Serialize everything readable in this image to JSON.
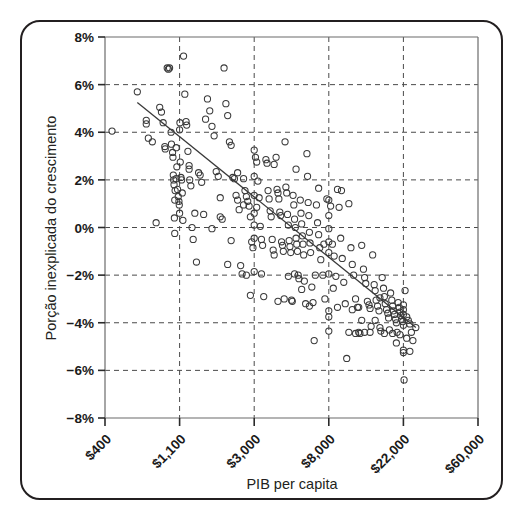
{
  "chart_data": {
    "type": "scatter",
    "title": "",
    "xlabel": "PIB per capita",
    "ylabel": "Porção inexplicada do crescimento",
    "xscale": "log",
    "x_tick_labels": [
      "$400",
      "$1,100",
      "$3,000",
      "$8,000",
      "$22,000",
      "$60,000"
    ],
    "x_tick_values": [
      400,
      1100,
      3000,
      8000,
      22000,
      60000
    ],
    "y_tick_labels": [
      "8%",
      "6%",
      "4%",
      "2%",
      "0%",
      "−2%",
      "−4%",
      "−6%",
      "−8%"
    ],
    "y_tick_values": [
      8,
      6,
      4,
      2,
      0,
      -2,
      -4,
      -6,
      -8
    ],
    "ylim": [
      -8,
      8
    ],
    "xlim": [
      400,
      60000
    ],
    "grid": true,
    "grid_style": "dashed",
    "legend": "none",
    "marker": "open-circle",
    "marker_color": "#3a3a3a",
    "trendline": {
      "present": true,
      "x_start": 620,
      "y_start": 5.25,
      "x_end": 26000,
      "y_end": -4.2,
      "color": "#3a3a3a"
    },
    "points": [
      [
        440,
        4.05
      ],
      [
        620,
        5.7
      ],
      [
        700,
        4.5
      ],
      [
        700,
        4.35
      ],
      [
        720,
        3.75
      ],
      [
        760,
        3.6
      ],
      [
        800,
        0.2
      ],
      [
        840,
        5.05
      ],
      [
        860,
        4.85
      ],
      [
        880,
        4.4
      ],
      [
        900,
        3.4
      ],
      [
        905,
        3.3
      ],
      [
        930,
        6.7
      ],
      [
        945,
        6.65
      ],
      [
        960,
        6.7
      ],
      [
        980,
        4.0
      ],
      [
        985,
        3.5
      ],
      [
        1000,
        3.15
      ],
      [
        1005,
        2.95
      ],
      [
        1010,
        2.2
      ],
      [
        1020,
        1.8
      ],
      [
        1030,
        -0.25
      ],
      [
        1050,
        3.35
      ],
      [
        1060,
        2.55
      ],
      [
        1070,
        1.6
      ],
      [
        1080,
        1.3
      ],
      [
        1090,
        1.1
      ],
      [
        1095,
        0.95
      ],
      [
        1100,
        0.6
      ],
      [
        1100,
        4.1
      ],
      [
        1105,
        4.4
      ],
      [
        1110,
        2.75
      ],
      [
        1120,
        2.1
      ],
      [
        1130,
        2.0
      ],
      [
        1140,
        1.45
      ],
      [
        1150,
        0.3
      ],
      [
        1160,
        7.2
      ],
      [
        1180,
        5.6
      ],
      [
        1200,
        4.45
      ],
      [
        1210,
        4.3
      ],
      [
        1230,
        3.2
      ],
      [
        1250,
        2.45
      ],
      [
        1260,
        2.0
      ],
      [
        1280,
        1.75
      ],
      [
        1300,
        0.0
      ],
      [
        1320,
        -0.5
      ],
      [
        1350,
        0.6
      ],
      [
        1380,
        -1.45
      ],
      [
        1420,
        2.3
      ],
      [
        1450,
        2.2
      ],
      [
        1480,
        1.9
      ],
      [
        1520,
        0.55
      ],
      [
        1560,
        4.55
      ],
      [
        1600,
        5.4
      ],
      [
        1650,
        4.9
      ],
      [
        1700,
        4.25
      ],
      [
        1750,
        3.85
      ],
      [
        1800,
        2.35
      ],
      [
        1850,
        2.15
      ],
      [
        1900,
        1.25
      ],
      [
        1950,
        0.35
      ],
      [
        2000,
        6.7
      ],
      [
        2050,
        5.2
      ],
      [
        2100,
        4.7
      ],
      [
        2150,
        3.6
      ],
      [
        2200,
        3.45
      ],
      [
        2250,
        2.1
      ],
      [
        2300,
        2.05
      ],
      [
        2350,
        1.35
      ],
      [
        2400,
        1.15
      ],
      [
        2450,
        0.75
      ],
      [
        2500,
        -1.6
      ],
      [
        2550,
        -1.95
      ],
      [
        2600,
        2.05
      ],
      [
        2650,
        1.55
      ],
      [
        2700,
        1.3
      ],
      [
        2750,
        1.1
      ],
      [
        2800,
        0.9
      ],
      [
        2850,
        0.45
      ],
      [
        2900,
        -0.6
      ],
      [
        2950,
        -0.85
      ],
      [
        3000,
        3.25
      ],
      [
        3000,
        2.15
      ],
      [
        3000,
        1.35
      ],
      [
        3000,
        0.6
      ],
      [
        3000,
        0.1
      ],
      [
        3000,
        -0.45
      ],
      [
        3000,
        -1.85
      ],
      [
        3050,
        2.95
      ],
      [
        3100,
        2.75
      ],
      [
        3150,
        1.95
      ],
      [
        3200,
        1.25
      ],
      [
        3250,
        0.05
      ],
      [
        3300,
        -0.5
      ],
      [
        3350,
        -0.75
      ],
      [
        3400,
        -2.9
      ],
      [
        3500,
        2.85
      ],
      [
        3550,
        2.7
      ],
      [
        3600,
        1.55
      ],
      [
        3650,
        1.2
      ],
      [
        3700,
        0.7
      ],
      [
        3750,
        0.45
      ],
      [
        3800,
        -0.5
      ],
      [
        3850,
        -0.95
      ],
      [
        3900,
        -1.15
      ],
      [
        4000,
        2.95
      ],
      [
        4050,
        1.6
      ],
      [
        4100,
        1.45
      ],
      [
        4150,
        1.2
      ],
      [
        4200,
        0.65
      ],
      [
        4250,
        0.5
      ],
      [
        4300,
        -0.6
      ],
      [
        4350,
        -0.75
      ],
      [
        4400,
        -1.0
      ],
      [
        4500,
        3.6
      ],
      [
        4550,
        1.7
      ],
      [
        4600,
        1.45
      ],
      [
        4650,
        0.55
      ],
      [
        4700,
        0.1
      ],
      [
        4750,
        -0.55
      ],
      [
        4800,
        -0.8
      ],
      [
        4850,
        -1.05
      ],
      [
        4900,
        -3.05
      ],
      [
        4950,
        -3.1
      ],
      [
        5000,
        1.35
      ],
      [
        5050,
        0.95
      ],
      [
        5100,
        0.35
      ],
      [
        5150,
        0.0
      ],
      [
        5200,
        -0.45
      ],
      [
        5250,
        -0.7
      ],
      [
        5300,
        -1.0
      ],
      [
        5350,
        -2.0
      ],
      [
        5400,
        -2.15
      ],
      [
        5500,
        1.15
      ],
      [
        5550,
        0.6
      ],
      [
        5600,
        0.15
      ],
      [
        5650,
        -0.35
      ],
      [
        5700,
        -0.7
      ],
      [
        5750,
        -1.15
      ],
      [
        5800,
        -2.25
      ],
      [
        5900,
        -3.2
      ],
      [
        6000,
        3.1
      ],
      [
        6050,
        2.15
      ],
      [
        6100,
        1.05
      ],
      [
        6150,
        0.5
      ],
      [
        6200,
        -0.2
      ],
      [
        6250,
        -0.65
      ],
      [
        6300,
        -1.05
      ],
      [
        6400,
        -2.5
      ],
      [
        6500,
        -3.15
      ],
      [
        6600,
        -4.75
      ],
      [
        6800,
        0.95
      ],
      [
        6900,
        0.2
      ],
      [
        7000,
        -0.3
      ],
      [
        7100,
        -0.85
      ],
      [
        7200,
        -1.35
      ],
      [
        7400,
        -2.0
      ],
      [
        7600,
        -3.0
      ],
      [
        7800,
        1.2
      ],
      [
        8000,
        1.15
      ],
      [
        8000,
        0.5
      ],
      [
        8000,
        -0.05
      ],
      [
        8000,
        -0.6
      ],
      [
        8000,
        -1.05
      ],
      [
        8000,
        -1.95
      ],
      [
        8000,
        -3.5
      ],
      [
        8000,
        -3.75
      ],
      [
        8000,
        -4.35
      ],
      [
        8200,
        0.9
      ],
      [
        8400,
        -0.7
      ],
      [
        8600,
        -1.2
      ],
      [
        8800,
        -2.05
      ],
      [
        9000,
        1.6
      ],
      [
        9200,
        0.85
      ],
      [
        9400,
        -0.45
      ],
      [
        9600,
        -1.3
      ],
      [
        9800,
        -2.3
      ],
      [
        10000,
        -3.2
      ],
      [
        10200,
        -5.5
      ],
      [
        10500,
        1.0
      ],
      [
        10800,
        -0.85
      ],
      [
        11000,
        -1.55
      ],
      [
        11200,
        -2.0
      ],
      [
        11500,
        -3.0
      ],
      [
        11800,
        -3.35
      ],
      [
        12000,
        -4.4
      ],
      [
        12200,
        -4.45
      ],
      [
        12500,
        -0.75
      ],
      [
        12800,
        -1.75
      ],
      [
        13000,
        -2.1
      ],
      [
        13200,
        -2.35
      ],
      [
        13500,
        -3.1
      ],
      [
        13800,
        -3.25
      ],
      [
        14000,
        -3.4
      ],
      [
        14200,
        -4.15
      ],
      [
        14500,
        -1.15
      ],
      [
        14800,
        -2.4
      ],
      [
        15000,
        -2.65
      ],
      [
        15200,
        -3.05
      ],
      [
        15500,
        -3.3
      ],
      [
        15800,
        -3.5
      ],
      [
        16000,
        -4.2
      ],
      [
        16200,
        -4.35
      ],
      [
        16500,
        -2.1
      ],
      [
        16800,
        -2.55
      ],
      [
        17000,
        -2.9
      ],
      [
        17200,
        -3.2
      ],
      [
        17500,
        -3.45
      ],
      [
        17800,
        -3.6
      ],
      [
        18000,
        -3.8
      ],
      [
        18200,
        -4.3
      ],
      [
        18500,
        -2.75
      ],
      [
        18800,
        -3.05
      ],
      [
        19000,
        -3.3
      ],
      [
        19200,
        -3.5
      ],
      [
        19500,
        -3.65
      ],
      [
        19800,
        -3.85
      ],
      [
        20000,
        -4.0
      ],
      [
        20200,
        -4.4
      ],
      [
        20500,
        -3.15
      ],
      [
        20800,
        -3.35
      ],
      [
        21000,
        -3.55
      ],
      [
        21200,
        -3.7
      ],
      [
        21500,
        -3.85
      ],
      [
        21800,
        -3.95
      ],
      [
        22000,
        -4.1
      ],
      [
        22000,
        -3.25
      ],
      [
        22000,
        -3.45
      ],
      [
        22000,
        -3.65
      ],
      [
        22000,
        -5.15
      ],
      [
        22000,
        -5.25
      ],
      [
        22500,
        -2.65
      ],
      [
        23000,
        -3.75
      ],
      [
        23500,
        -3.9
      ],
      [
        24000,
        -4.05
      ],
      [
        24500,
        -4.4
      ],
      [
        25000,
        -4.75
      ],
      [
        26000,
        -4.2
      ],
      [
        22200,
        -6.4
      ],
      [
        12000,
        -3.35
      ],
      [
        9500,
        1.55
      ],
      [
        7000,
        1.65
      ],
      [
        5200,
        2.45
      ],
      [
        3900,
        2.65
      ],
      [
        2850,
        -2.85
      ],
      [
        2100,
        -1.55
      ],
      [
        1250,
        2.6
      ],
      [
        1050,
        2.05
      ],
      [
        1030,
        1.15
      ],
      [
        1025,
        0.4
      ],
      [
        1015,
        2.0
      ],
      [
        1035,
        1.55
      ],
      [
        4100,
        -3.1
      ],
      [
        4450,
        -3.0
      ],
      [
        4700,
        -2.05
      ],
      [
        5100,
        -1.95
      ],
      [
        6700,
        -2.0
      ],
      [
        7500,
        -0.7
      ],
      [
        8500,
        -2.55
      ],
      [
        9000,
        -3.35
      ],
      [
        10500,
        -4.4
      ],
      [
        11500,
        -4.45
      ],
      [
        13000,
        -4.4
      ],
      [
        14000,
        -4.4
      ],
      [
        17000,
        -4.45
      ],
      [
        19000,
        -4.45
      ],
      [
        21000,
        -4.5
      ],
      [
        23000,
        -4.65
      ],
      [
        24000,
        -5.2
      ],
      [
        20000,
        -4.85
      ],
      [
        16000,
        -2.95
      ],
      [
        15000,
        -3.9
      ],
      [
        12500,
        -3.9
      ],
      [
        11000,
        -3.45
      ],
      [
        6200,
        -3.3
      ],
      [
        5600,
        -2.6
      ],
      [
        3300,
        -1.95
      ],
      [
        2700,
        -2.0
      ],
      [
        2200,
        -0.55
      ],
      [
        1700,
        -0.05
      ],
      [
        1900,
        0.45
      ],
      [
        2400,
        2.3
      ],
      [
        2600,
        0.95
      ],
      [
        3100,
        0.85
      ]
    ]
  }
}
